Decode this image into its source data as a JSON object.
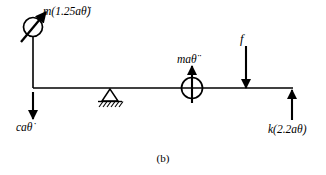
{
  "figure": {
    "caption": "(b)",
    "stroke_color": "#000000",
    "background_color": "#ffffff"
  },
  "labels": {
    "inertia_moment": {
      "text": "m(1.25aθ̈)",
      "name": "label-inertia-moment"
    },
    "inertia_force": {
      "text": "maθ̈",
      "name": "label-inertia-force"
    },
    "applied_force": {
      "text": "f",
      "name": "label-applied-force"
    },
    "damping_force": {
      "text": "caθ̇",
      "name": "label-damping-force"
    },
    "spring_force": {
      "text": "k(2.2aθ)",
      "name": "label-spring-force"
    }
  },
  "elements": {
    "beam": "horizontal-beam",
    "left_member": "left-vertical-member",
    "pivot": "pivot-support-triangle",
    "ground_hatching": "ground-hatching",
    "moment_symbol": "circle-diagonal-arrow-symbol",
    "force_symbol": "circle-vertical-arrow-symbol",
    "arrow_damping": "down-arrow-damping",
    "arrow_applied": "down-arrow-applied-force",
    "arrow_spring": "up-arrow-spring-force"
  }
}
